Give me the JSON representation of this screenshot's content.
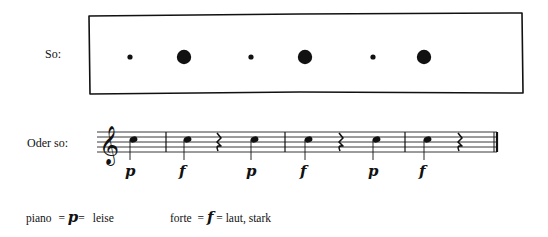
{
  "row1": {
    "label": "So:",
    "dots": [
      {
        "x": 130,
        "r": 2.6,
        "dynamic": "p"
      },
      {
        "x": 184,
        "r": 7.2,
        "dynamic": "f"
      },
      {
        "x": 251,
        "r": 2.6,
        "dynamic": "p"
      },
      {
        "x": 305,
        "r": 7.2,
        "dynamic": "f"
      },
      {
        "x": 373,
        "r": 2.6,
        "dynamic": "p"
      },
      {
        "x": 424,
        "r": 7.2,
        "dynamic": "f"
      }
    ]
  },
  "row2": {
    "label": "Oder so:",
    "clef": "treble",
    "measures": 4,
    "notes": [
      {
        "x": 130,
        "dynamic": "p"
      },
      {
        "x": 184,
        "dynamic": "f"
      },
      {
        "x": 251,
        "dynamic": "p"
      },
      {
        "x": 305,
        "dynamic": "f"
      },
      {
        "x": 373,
        "dynamic": "p"
      },
      {
        "x": 424,
        "dynamic": "f"
      }
    ],
    "rests_x": [
      218,
      340,
      459
    ],
    "barlines_x": [
      166,
      285,
      405
    ]
  },
  "legend": {
    "piano_word": "piano",
    "piano_eq1": "=",
    "piano_symbol": "p",
    "piano_eq2": "=",
    "piano_meaning": "leise",
    "forte_word": "forte",
    "forte_eq1": "=",
    "forte_symbol": "f",
    "forte_eq2": "=",
    "forte_meaning": "laut, stark"
  }
}
